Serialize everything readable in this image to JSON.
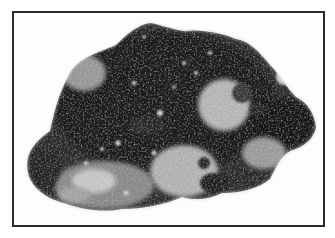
{
  "image": {
    "subject": "mineral rock specimen",
    "style": "grayscale photograph",
    "frame_color": "#2a2a2a",
    "background_color": "#fdfdfd",
    "tones": {
      "dark": "#1e1e1e",
      "mid_dark": "#3c3c3c",
      "mid": "#7a7a7a",
      "light": "#bdbdbd",
      "highlight": "#e2e2e2"
    }
  }
}
